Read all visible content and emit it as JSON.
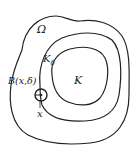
{
  "diagram": {
    "regions": [
      {
        "id": "omega",
        "label": "Ω"
      },
      {
        "id": "k-delta",
        "label": "K",
        "subscript": "δ"
      },
      {
        "id": "k",
        "label": "K"
      }
    ],
    "ball": {
      "label": "B(x,δ)"
    },
    "point": {
      "label": "x"
    },
    "stroke_color": "#222222"
  }
}
